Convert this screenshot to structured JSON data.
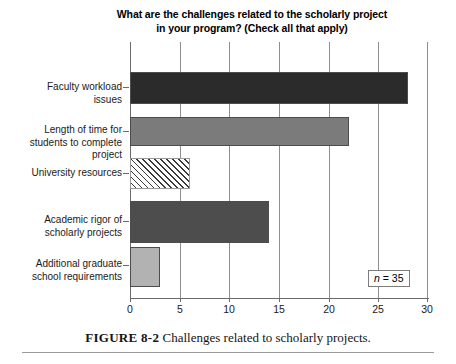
{
  "chart_data": {
    "type": "bar",
    "orientation": "horizontal",
    "title": "What are the challenges related to the scholarly project in your program? (Check all that apply)",
    "title_lines": [
      "What are the challenges related to the scholarly project",
      "in your program? (Check all that apply)"
    ],
    "categories": [
      "Faculty workload issues",
      "Length of time for students to complete project",
      "University resources",
      "Academic rigor of scholarly projects",
      "Additional graduate school requirements"
    ],
    "category_lines": [
      [
        "Faculty workload",
        "issues"
      ],
      [
        "Length of time for",
        "students to complete",
        "project"
      ],
      [
        "University resources"
      ],
      [
        "Academic rigor of",
        "scholarly projects"
      ],
      [
        "Additional graduate",
        "school requirements"
      ]
    ],
    "values": [
      28,
      22,
      6,
      14,
      3
    ],
    "xlabel": "",
    "ylabel": "",
    "xlim": [
      0,
      30
    ],
    "xticks": [
      0,
      5,
      10,
      15,
      20,
      25,
      30
    ],
    "xtick_labels": [
      "0",
      "5",
      "10",
      "15",
      "20",
      "25",
      "30"
    ],
    "grid": "vertical",
    "legend": "none",
    "annotation": {
      "symbol": "n",
      "text": " = 35",
      "full": "n = 35"
    },
    "bar_colors": [
      "#2b2b2b",
      "#7b7b7b",
      "#ffffff",
      "#4d4d4d",
      "#b2b2b2"
    ],
    "bar_fill_styles": [
      "solid",
      "solid",
      "diagonal-hatch",
      "solid",
      "solid"
    ],
    "bar_border_color": "#4c4c4c",
    "gridline_color": "#8e8e8e"
  },
  "caption": {
    "figure_number": "FIGURE 8-2",
    "text": "Challenges related to scholarly projects."
  }
}
